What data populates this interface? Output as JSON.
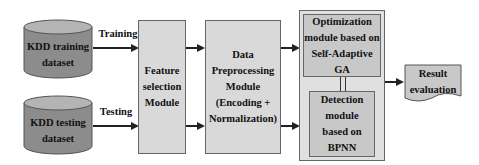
{
  "diagram": {
    "nodes": {
      "kdd_training": "KDD training dataset",
      "kdd_training_l1": "KDD training",
      "kdd_training_l2": "dataset",
      "kdd_testing_l1": "KDD testing",
      "kdd_testing_l2": "dataset",
      "feature_l1": "Feature",
      "feature_l2": "selection",
      "feature_l3": "Module",
      "prep_l1": "Data",
      "prep_l2": "Preprocessing",
      "prep_l3": "Module",
      "prep_l4": "(Encoding +",
      "prep_l5": "Normalization)",
      "opt_l1": "Optimization",
      "opt_l2": "module based on",
      "opt_l3": "Self-Adaptive",
      "opt_l4": "GA",
      "det_l1": "Detection",
      "det_l2": "module",
      "det_l3": "based on",
      "det_l4": "BPNN",
      "result_l1": "Result",
      "result_l2": "evaluation"
    },
    "edges": {
      "training_label": "Training",
      "testing_label": "Testing"
    },
    "colors": {
      "cylinder": "#8c8c8c",
      "box": "#d9d9d9",
      "inner_box": "#c8c8c8"
    }
  }
}
